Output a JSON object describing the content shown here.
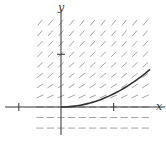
{
  "diagram": {
    "type": "slope-field",
    "equation": "dy/dx = sqrt(y) for y > 0, 0 for y <= 0",
    "axis_labels": {
      "x": "x",
      "y": "y"
    },
    "x_range": [
      -1.06,
      1.98
    ],
    "y_range": [
      -0.53,
      1.81
    ],
    "ticks": {
      "x": [
        -0.8,
        1
      ],
      "y": [
        1
      ]
    },
    "grid": {
      "x_values": [
        -0.4,
        -0.2,
        0,
        0.2,
        0.4,
        0.6,
        0.8,
        1.0,
        1.2,
        1.4,
        1.6
      ],
      "y_values": [
        -0.4,
        -0.2,
        0,
        0.2,
        0.4,
        0.6,
        0.8,
        1.0,
        1.2,
        1.4,
        1.6
      ]
    },
    "solution_curve": {
      "formula": "y = x^2 / 4",
      "x_start": 0,
      "x_end": 1.69
    },
    "colors": {
      "axis": "#333333",
      "segments": "#9a9a9a",
      "curve": "#333333",
      "background": "#ffffff"
    }
  }
}
